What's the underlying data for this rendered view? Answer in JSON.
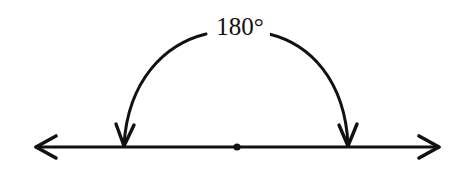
{
  "diagram": {
    "angle_label": "180°",
    "angle_value_degrees": 180,
    "elements": {
      "line": "straight line with arrows at both ends",
      "vertex": "point at center of line",
      "arc": "semicircular arc with arrowheads pointing down to the line on each side"
    },
    "colors": {
      "stroke": "#111111",
      "background": "#ffffff"
    }
  }
}
